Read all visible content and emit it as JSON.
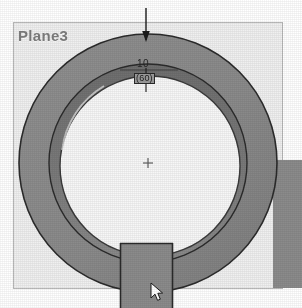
{
  "viewport": {
    "width": 302,
    "height": 308,
    "background_color": "#ffffff"
  },
  "plane": {
    "label": "Plane3",
    "label_color": "#7d7d7d",
    "fill_color": "#f0f0f0",
    "border_color": "#b5b5b5",
    "x": 13,
    "y": 22,
    "width": 270,
    "height": 267
  },
  "dimensions": {
    "primary": {
      "value": "10",
      "color": "#262626",
      "x": 137,
      "y": 59
    },
    "secondary": {
      "value": "(60)",
      "selected": true,
      "color": "#1d1d1d",
      "highlight_color": "#9b9b9b",
      "x": 134,
      "y": 73
    },
    "leader": {
      "name": "dimension-arrow",
      "direction": "down",
      "x": 146,
      "y_start": 8,
      "y_end": 42,
      "color": "#1a1a1a"
    }
  },
  "geometry": {
    "part_name": "ring-with-slot",
    "body_color": "#8b8b8b",
    "body_shadow_color": "#6f6f6f",
    "bore_color": "#f7f7f7",
    "outline_color": "#2b2b2b",
    "center_mark": {
      "name": "center-mark",
      "x": 148,
      "y": 163,
      "color": "#6a6a6a"
    },
    "outer_circle": {
      "cx": 148,
      "cy": 163,
      "r": 129
    },
    "inner_band_circle": {
      "cx": 148,
      "cy": 163,
      "r": 96
    },
    "bore_circle": {
      "cx": 150,
      "cy": 166,
      "r": 88
    },
    "slot": {
      "name": "bottom-slot",
      "x": 120,
      "y": 243,
      "width": 53,
      "height": 65
    },
    "right_block": {
      "name": "right-extrusion-block",
      "x": 273,
      "y": 160,
      "width": 29,
      "height": 128,
      "color": "#8b8b8b"
    }
  },
  "cursor": {
    "name": "mouse-cursor",
    "x": 150,
    "y": 282,
    "fill_color": "#ffffff",
    "stroke_color": "#1a1a1a"
  }
}
